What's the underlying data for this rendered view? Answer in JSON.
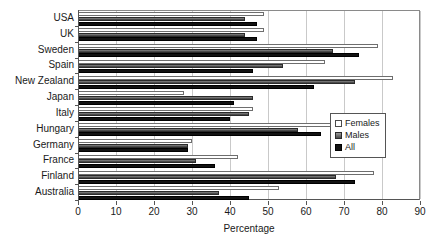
{
  "chart_data": {
    "type": "bar",
    "orientation": "horizontal",
    "title": "",
    "xlabel": "Percentage",
    "ylabel": "",
    "xlim": [
      0,
      90
    ],
    "xticks": [
      0,
      10,
      20,
      30,
      40,
      50,
      60,
      70,
      80,
      90
    ],
    "grid": true,
    "legend_position": "right-middle",
    "categories": [
      "USA",
      "UK",
      "Sweden",
      "Spain",
      "New Zealand",
      "Japan",
      "Italy",
      "Hungary",
      "Germany",
      "France",
      "Finland",
      "Australia"
    ],
    "series": [
      {
        "name": "Females",
        "color": "#ffffff",
        "values": [
          49,
          49,
          79,
          65,
          83,
          28,
          46,
          67,
          30,
          42,
          78,
          53
        ]
      },
      {
        "name": "Males",
        "color": "#5e5e5e",
        "values": [
          44,
          44,
          67,
          54,
          73,
          46,
          45,
          58,
          29,
          31,
          68,
          37
        ]
      },
      {
        "name": "All",
        "color": "#121212",
        "values": [
          47,
          47,
          74,
          46,
          62,
          41,
          40,
          64,
          29,
          36,
          73,
          45
        ]
      }
    ]
  },
  "legend": {
    "items": [
      {
        "label": "Females",
        "key": "females"
      },
      {
        "label": "Males",
        "key": "males"
      },
      {
        "label": "All",
        "key": "all"
      }
    ]
  }
}
